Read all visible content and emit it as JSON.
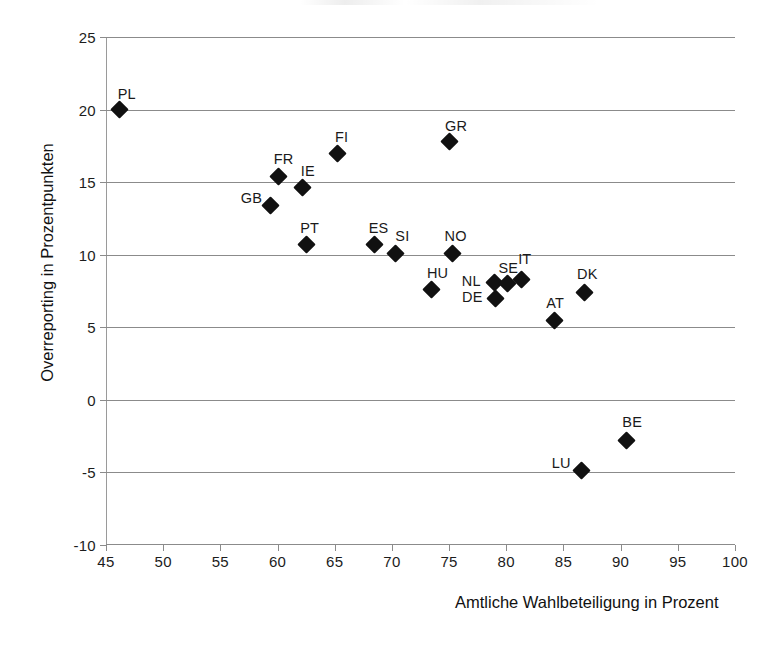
{
  "chart_data": {
    "type": "scatter",
    "title": "",
    "xlabel": "Amtliche Wahlbeteiligung in Prozent",
    "ylabel": "Overreporting in Prozentpunkten",
    "xlim": [
      45,
      100
    ],
    "ylim": [
      -10,
      25
    ],
    "xticks": [
      45,
      50,
      55,
      60,
      65,
      70,
      75,
      80,
      85,
      90,
      95,
      100
    ],
    "yticks": [
      25,
      20,
      15,
      10,
      5,
      0,
      -5,
      -10
    ],
    "grid": "horizontal",
    "legend": "none",
    "marker": "diamond",
    "marker_color": "#111111",
    "points": [
      {
        "label": "PL",
        "x": 46.2,
        "y": 20.0,
        "label_dx": -2,
        "label_dy": -24
      },
      {
        "label": "FI",
        "x": 65.2,
        "y": 17.0,
        "label_dx": -2,
        "label_dy": -24
      },
      {
        "label": "GR",
        "x": 75.0,
        "y": 17.8,
        "label_dx": -4,
        "label_dy": -24
      },
      {
        "label": "FR",
        "x": 60.1,
        "y": 15.4,
        "label_dx": -5,
        "label_dy": -25
      },
      {
        "label": "IE",
        "x": 62.2,
        "y": 14.6,
        "label_dx": -2,
        "label_dy": -25
      },
      {
        "label": "GB",
        "x": 59.4,
        "y": 13.4,
        "label_dx": -30,
        "label_dy": -15
      },
      {
        "label": "PT",
        "x": 62.5,
        "y": 10.7,
        "label_dx": -6,
        "label_dy": -25
      },
      {
        "label": "ES",
        "x": 68.5,
        "y": 10.7,
        "label_dx": -6,
        "label_dy": -25
      },
      {
        "label": "SI",
        "x": 70.3,
        "y": 10.1,
        "label_dx": 0,
        "label_dy": -25
      },
      {
        "label": "NO",
        "x": 75.3,
        "y": 10.1,
        "label_dx": -8,
        "label_dy": -25
      },
      {
        "label": "HU",
        "x": 73.5,
        "y": 7.6,
        "label_dx": -5,
        "label_dy": -25
      },
      {
        "label": "NL",
        "x": 79.0,
        "y": 8.1,
        "label_dx": -33,
        "label_dy": -9
      },
      {
        "label": "SE",
        "x": 80.1,
        "y": 8.0,
        "label_dx": -9,
        "label_dy": -24
      },
      {
        "label": "IT",
        "x": 81.3,
        "y": 8.3,
        "label_dx": -3,
        "label_dy": -28
      },
      {
        "label": "DE",
        "x": 79.1,
        "y": 7.0,
        "label_dx": -34,
        "label_dy": -9
      },
      {
        "label": "AT",
        "x": 84.2,
        "y": 5.5,
        "label_dx": -8,
        "label_dy": -25
      },
      {
        "label": "DK",
        "x": 86.8,
        "y": 7.4,
        "label_dx": -7,
        "label_dy": -26
      },
      {
        "label": "BE",
        "x": 90.5,
        "y": -2.8,
        "label_dx": -4,
        "label_dy": -26
      },
      {
        "label": "LU",
        "x": 86.6,
        "y": -4.9,
        "label_dx": -30,
        "label_dy": -16
      }
    ]
  }
}
